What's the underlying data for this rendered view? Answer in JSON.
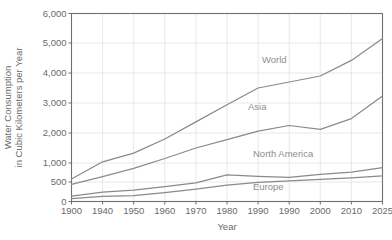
{
  "chart_data": {
    "type": "line",
    "title": "",
    "xlabel": "Year",
    "ylabel": "Water Consumption in Cubic Kilometers per Year",
    "ylabel_line1": "Water Consumption",
    "ylabel_line2": "in Cubic Kilometers per Year",
    "categories": [
      "1900",
      "1940",
      "1950",
      "1960",
      "1970",
      "1980",
      "1990",
      "1990",
      "2000",
      "2010",
      "2025"
    ],
    "xtick_labels": [
      "1900",
      "1940",
      "1950",
      "1960",
      "1970",
      "1980",
      "1990",
      "1990",
      "2000",
      "2010",
      "2025"
    ],
    "ytick_labels": [
      "0",
      "500",
      "1,000",
      "2,000",
      "3,000",
      "4,000",
      "5,000",
      "6,000"
    ],
    "ytick_values": [
      0,
      500,
      1000,
      2000,
      3000,
      4000,
      5000,
      6000
    ],
    "ylim": [
      0,
      6000
    ],
    "y_scale_note": "broken axis: 0-1000 compressed, 1000-6000 linear",
    "grid": true,
    "legend_position": "inline",
    "series": [
      {
        "name": "World",
        "label": "World",
        "values": [
          580,
          1040,
          1330,
          1800,
          2370,
          2940,
          3500,
          3700,
          3900,
          4420,
          5150
        ]
      },
      {
        "name": "Asia",
        "label": "Asia",
        "values": [
          440,
          640,
          860,
          1150,
          1500,
          1780,
          2060,
          2250,
          2120,
          2480,
          3230
        ]
      },
      {
        "name": "North America",
        "label": "North America",
        "values": [
          140,
          240,
          290,
          380,
          480,
          690,
          650,
          620,
          700,
          760,
          880
        ]
      },
      {
        "name": "Europe",
        "label": "Europe",
        "values": [
          75,
          130,
          150,
          230,
          320,
          420,
          490,
          530,
          570,
          610,
          660
        ]
      }
    ],
    "colors": {
      "line": "#8a8a8a",
      "grid": "#e2e2e2",
      "frame": "#6f6f6f",
      "text": "#6a6a6a",
      "series_label": "#8e8e8e",
      "background": "#ffffff"
    }
  }
}
